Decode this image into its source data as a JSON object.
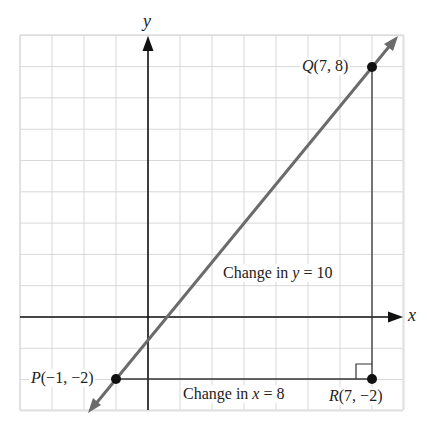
{
  "diagram": {
    "axes": {
      "x_label": "x",
      "y_label": "y"
    },
    "grid": {
      "x_min": -4,
      "x_max": 8,
      "y_min": -3,
      "y_max": 9,
      "cell_px": 31.6
    },
    "points": [
      {
        "id": "P",
        "name": "P",
        "coords": "(−1, −2)",
        "x": -1,
        "y": -2
      },
      {
        "id": "Q",
        "name": "Q",
        "coords": "(7, 8)",
        "x": 7,
        "y": 8
      },
      {
        "id": "R",
        "name": "R",
        "coords": "(7, −2)",
        "x": 7,
        "y": -2
      }
    ],
    "labels": {
      "change_y_prefix": "Change in ",
      "change_y_var": "y",
      "change_y_suffix": " = 10",
      "change_x_prefix": "Change in ",
      "change_x_var": "x",
      "change_x_suffix": " = 8"
    },
    "colors": {
      "grid": "#d8d8d8",
      "line": "#6b6b6b",
      "axis": "#111111",
      "point": "#111111"
    }
  }
}
